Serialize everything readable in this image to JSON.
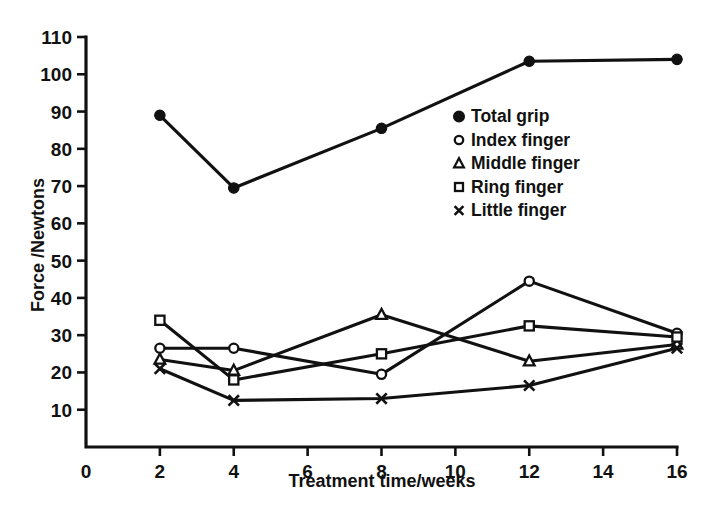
{
  "chart_data": {
    "type": "line",
    "title": "",
    "xlabel": "Treatment time/weeks",
    "ylabel": "Force /Newtons",
    "xlim": [
      0,
      16
    ],
    "ylim": [
      0,
      110
    ],
    "xticks": [
      0,
      2,
      4,
      6,
      8,
      10,
      12,
      14,
      16
    ],
    "yticks": [
      10,
      20,
      30,
      40,
      50,
      60,
      70,
      80,
      90,
      100,
      110
    ],
    "grid": false,
    "legend_position": "center-right",
    "x": [
      2,
      4,
      8,
      12,
      16
    ],
    "series": [
      {
        "name": "Total grip",
        "marker": "filled-circle",
        "values": [
          89,
          69.5,
          85.5,
          103.5,
          104
        ]
      },
      {
        "name": "Index finger",
        "marker": "open-circle",
        "values": [
          26.5,
          26.5,
          19.5,
          44.5,
          30.5
        ]
      },
      {
        "name": "Middle finger",
        "marker": "triangle",
        "values": [
          23.5,
          20.5,
          35.5,
          23,
          27.5
        ]
      },
      {
        "name": "Ring finger",
        "marker": "square",
        "values": [
          34,
          18,
          25,
          32.5,
          29.5
        ]
      },
      {
        "name": "Little finger",
        "marker": "cross",
        "values": [
          21,
          12.5,
          13,
          16.5,
          26.5
        ]
      }
    ]
  },
  "axes": {
    "x_title": "Treatment time/weeks",
    "y_title": "Force /Newtons",
    "x_tick_labels": [
      "0",
      "2",
      "4",
      "6",
      "8",
      "10",
      "12",
      "14",
      "16"
    ],
    "y_tick_labels": [
      "10",
      "20",
      "30",
      "40",
      "50",
      "60",
      "70",
      "80",
      "90",
      "100",
      "110"
    ]
  },
  "legend": {
    "entries": [
      {
        "label": "Total grip",
        "marker": "filled-circle-marker"
      },
      {
        "label": "Index finger",
        "marker": "open-circle-marker"
      },
      {
        "label": "Middle finger",
        "marker": "triangle-marker"
      },
      {
        "label": "Ring finger",
        "marker": "square-marker"
      },
      {
        "label": "Little finger",
        "marker": "cross-marker"
      }
    ]
  },
  "colors": {
    "ink": "#111111",
    "background": "#ffffff"
  }
}
